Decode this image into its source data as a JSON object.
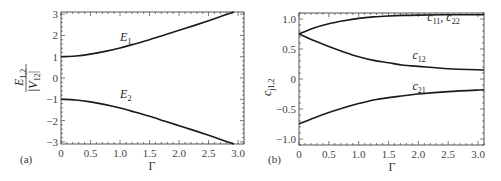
{
  "chart_data": [
    {
      "type": "line",
      "panel_label": "(a)",
      "title": "",
      "xlabel": "Γ",
      "ylabel": "E1,2 / |V12|",
      "ylabel_numerator": "E",
      "ylabel_numerator_sub": "1,2",
      "ylabel_denominator": "|V",
      "ylabel_denominator_sub": "12",
      "ylabel_denominator_close": "|",
      "xlim": [
        0,
        3.1
      ],
      "ylim": [
        -3.1,
        3.1
      ],
      "grid": false,
      "xticks": [
        0,
        0.5,
        1.0,
        1.5,
        2.0,
        2.5,
        3.0
      ],
      "xtick_labels": [
        "0",
        "0.5",
        "1.0",
        "1.5",
        "2.0",
        "2.5",
        "3.0"
      ],
      "yticks": [
        3,
        2,
        1,
        0,
        -1,
        -2,
        -3
      ],
      "ytick_labels": [
        "3",
        "2",
        "1",
        "0",
        "−1",
        "−2",
        "−3"
      ],
      "series": [
        {
          "name": "E1",
          "label": "E",
          "label_sub": "1",
          "label_pos": [
            1.0,
            1.75
          ],
          "x": [
            0,
            0.25,
            0.5,
            0.75,
            1.0,
            1.25,
            1.5,
            1.75,
            2.0,
            2.25,
            2.5,
            2.75,
            2.93
          ],
          "y": [
            1.0,
            1.03,
            1.12,
            1.25,
            1.41,
            1.6,
            1.8,
            2.02,
            2.24,
            2.46,
            2.69,
            2.93,
            3.1
          ]
        },
        {
          "name": "E2",
          "label": "E",
          "label_sub": "2",
          "label_pos": [
            1.0,
            -0.95
          ],
          "x": [
            0,
            0.25,
            0.5,
            0.75,
            1.0,
            1.25,
            1.5,
            1.75,
            2.0,
            2.25,
            2.5,
            2.75,
            2.93
          ],
          "y": [
            -1.0,
            -1.03,
            -1.12,
            -1.25,
            -1.41,
            -1.6,
            -1.8,
            -2.02,
            -2.24,
            -2.46,
            -2.69,
            -2.93,
            -3.1
          ]
        }
      ]
    },
    {
      "type": "line",
      "panel_label": "(b)",
      "title": "",
      "xlabel": "Γ",
      "ylabel": "cj1,2",
      "ylabel_main": "c",
      "ylabel_sub": "j1,2",
      "xlim": [
        0,
        3.1
      ],
      "ylim": [
        -1.1,
        1.1
      ],
      "grid": false,
      "xticks": [
        0,
        0.5,
        1.0,
        1.5,
        2.0,
        2.5,
        3.0
      ],
      "xtick_labels": [
        "0",
        "0.5",
        "1.0",
        "1.5",
        "2.0",
        "2.5",
        "3.0"
      ],
      "yticks": [
        1.0,
        0.5,
        0,
        -0.5,
        -1.0
      ],
      "ytick_labels": [
        "1.0",
        "0.5",
        "0",
        "−0.5",
        "−1.0"
      ],
      "series": [
        {
          "name": "c11, c22",
          "label": "c",
          "label_sub": "11",
          "label_sep": ", c",
          "label_sub2": "22",
          "label_pos": [
            2.15,
            0.96
          ],
          "x": [
            0,
            0.25,
            0.5,
            0.75,
            1.0,
            1.25,
            1.5,
            1.75,
            2.0,
            2.5,
            3.1
          ],
          "y": [
            0.75,
            0.85,
            0.92,
            0.97,
            1.01,
            1.035,
            1.05,
            1.06,
            1.065,
            1.07,
            1.07
          ]
        },
        {
          "name": "c12",
          "label": "c",
          "label_sub": "12",
          "label_pos": [
            1.9,
            0.33
          ],
          "x": [
            0,
            0.25,
            0.5,
            0.75,
            1.0,
            1.25,
            1.5,
            1.75,
            2.0,
            2.5,
            3.1
          ],
          "y": [
            0.75,
            0.64,
            0.54,
            0.45,
            0.37,
            0.31,
            0.27,
            0.23,
            0.21,
            0.17,
            0.15
          ]
        },
        {
          "name": "c21",
          "label": "c",
          "label_sub": "21",
          "label_pos": [
            1.9,
            -0.18
          ],
          "x": [
            0,
            0.25,
            0.5,
            0.75,
            1.0,
            1.25,
            1.5,
            1.75,
            2.0,
            2.5,
            3.1
          ],
          "y": [
            -0.75,
            -0.65,
            -0.56,
            -0.48,
            -0.41,
            -0.35,
            -0.31,
            -0.28,
            -0.25,
            -0.21,
            -0.18
          ]
        }
      ]
    }
  ],
  "colors": {
    "curve": "#1a1a1a",
    "frame": "#444444",
    "text": "#333333"
  }
}
